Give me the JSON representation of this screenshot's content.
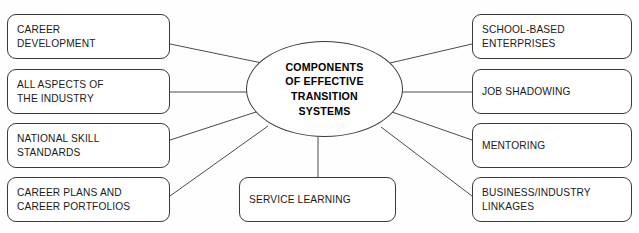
{
  "diagram": {
    "type": "radial-concept-map",
    "center": {
      "label": "COMPONENTS\nOF EFFECTIVE\nTRANSITION\nSYSTEMS",
      "shape": "ellipse"
    },
    "nodes_left": [
      {
        "id": "career-development",
        "label": "CAREER\nDEVELOPMENT"
      },
      {
        "id": "all-aspects-of-the-industry",
        "label": "ALL ASPECTS OF\nTHE INDUSTRY"
      },
      {
        "id": "national-skill-standards",
        "label": "NATIONAL SKILL\nSTANDARDS"
      },
      {
        "id": "career-plans-and-career-portfolios",
        "label": "CAREER PLANS AND\nCAREER PORTFOLIOS"
      }
    ],
    "nodes_right": [
      {
        "id": "school-based-enterprises",
        "label": "SCHOOL-BASED\nENTERPRISES"
      },
      {
        "id": "job-shadowing",
        "label": "JOB SHADOWING"
      },
      {
        "id": "mentoring",
        "label": "MENTORING"
      },
      {
        "id": "business-industry-linkages",
        "label": "BUSINESS/INDUSTRY\nLINKAGES"
      }
    ],
    "nodes_bottom": [
      {
        "id": "service-learning",
        "label": "SERVICE LEARNING"
      }
    ],
    "colors": {
      "background": "#fefefe",
      "box_border": "#3a3a3a",
      "box_fill": "#ffffff",
      "connector": "#4a4a4a",
      "text": "#1a1a1a",
      "center_text": "#000000"
    }
  }
}
